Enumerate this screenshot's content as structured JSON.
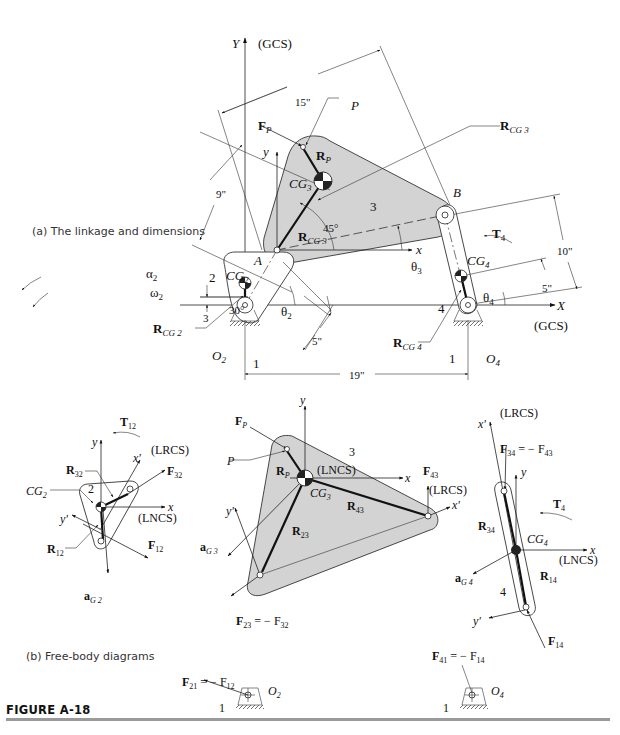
{
  "figure": {
    "label": "FIGURE A-18",
    "part_a_caption": "(a)  The linkage and dimensions",
    "part_b_caption": "(b)  Free-body diagrams"
  },
  "linkage": {
    "global_axis_y": "Y",
    "global_axis_x": "X",
    "gcs_label_top": "(GCS)",
    "gcs_label_right": "(GCS)",
    "local_x": "x",
    "local_y": "y",
    "dimensions": {
      "coupler_length": "15\"",
      "coupler_cg_offset": "9\"",
      "crank_length": "5\"",
      "ground_length": "19\"",
      "rocker_length": "10\"",
      "rocker_cg_offset": "5\"",
      "crank_cg_offset": "3",
      "cg2_angle": "30°",
      "rcg3_angle": "45°"
    },
    "points": {
      "A": "A",
      "B": "B",
      "P": "P",
      "O2": "O",
      "O2_sub": "2",
      "O4": "O",
      "O4_sub": "4"
    },
    "links": {
      "ground_left": "1",
      "ground_right": "1",
      "crank": "2",
      "coupler": "3",
      "rocker": "4"
    },
    "labels": {
      "FP": "F",
      "FP_sub": "P",
      "RP": "R",
      "RP_sub": "P",
      "CG3": "CG",
      "CG3_sub": "3",
      "CG2": "CG",
      "CG2_sub": "2",
      "CG4": "CG",
      "CG4_sub": "4",
      "RCG3": "R",
      "RCG3_sub": "CG 3",
      "RCG2": "R",
      "RCG2_sub": "CG 2",
      "RCG4": "R",
      "RCG4_sub": "CG 4",
      "theta2": "θ",
      "theta2_sub": "2",
      "theta3": "θ",
      "theta3_sub": "3",
      "theta4": "θ",
      "theta4_sub": "4",
      "alpha2": "α",
      "alpha2_sub": "2",
      "omega2": "ω",
      "omega2_sub": "2",
      "T4": "T",
      "T4_sub": "4"
    }
  },
  "fbd": {
    "link2": {
      "T12": "T",
      "T12_sub": "12",
      "lrcs": "(LRCS)",
      "lncs": "(LNCS)",
      "R32": "R",
      "R32_sub": "32",
      "F32": "F",
      "F32_sub": "32",
      "R12": "R",
      "R12_sub": "12",
      "F12": "F",
      "F12_sub": "12",
      "CG2": "CG",
      "CG2_sub": "2",
      "aG2": "a",
      "aG2_sub": "G 2",
      "link_num": "2",
      "x": "x",
      "y": "y",
      "xp": "x'",
      "yp": "y'"
    },
    "link3": {
      "FP": "F",
      "FP_sub": "P",
      "P": "P",
      "RP": "R",
      "RP_sub": "P",
      "lncs": "(LNCS)",
      "CG3": "CG",
      "CG3_sub": "3",
      "R43": "R",
      "R43_sub": "43",
      "R23": "R",
      "R23_sub": "23",
      "F43": "F",
      "F43_sub": "43",
      "lrcs": "(LRCS)",
      "aG3": "a",
      "aG3_sub": "G 3",
      "F23_eq": "F",
      "F23_eq_sub": "23",
      "eq1": " =  − F",
      "F32_sub": "32",
      "link_num": "3",
      "x": "x",
      "y": "y",
      "xp": "x'",
      "yp": "y'"
    },
    "link4": {
      "lrcs": "(LRCS)",
      "F34": "F",
      "F34_sub": "34",
      "eq1": " =  − F",
      "F43_sub": "43",
      "T4": "T",
      "T4_sub": "4",
      "R34": "R",
      "R34_sub": "34",
      "CG4": "CG",
      "CG4_sub": "4",
      "lncs": "(LNCS)",
      "R14": "R",
      "R14_sub": "14",
      "aG4": "a",
      "aG4_sub": "G 4",
      "F14": "F",
      "F14_sub": "14",
      "link_num": "4",
      "x": "x",
      "y": "y",
      "xp": "x'",
      "yp": "y'"
    },
    "ground": {
      "F21": "F",
      "F21_sub": "21",
      "eq1": " =  − F",
      "F12_sub": "12",
      "F41": "F",
      "F41_sub": "41",
      "eq2": " =  − F",
      "F14_sub": "14",
      "O2": "O",
      "O2_sub": "2",
      "O4": "O",
      "O4_sub": "4",
      "num_left": "1",
      "num_right": "1"
    }
  }
}
